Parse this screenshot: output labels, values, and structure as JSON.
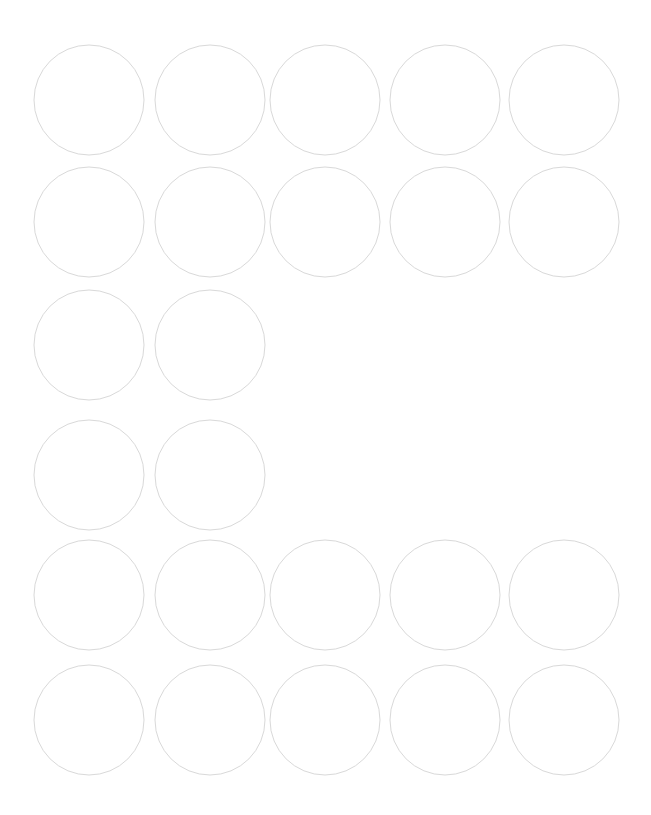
{
  "document": {
    "kind": "circle-label-sheet-template",
    "title": "Circular Label Sheet Template",
    "page_width": 651,
    "page_height": 815,
    "background_color": "#ffffff",
    "visible_text": ""
  },
  "style": {
    "outline_color": "#d9d9d9",
    "outline_width": 1,
    "fill_color": "#ffffff"
  },
  "grid": {
    "columns": 5,
    "rows": 6,
    "circle_diameter": 110,
    "column_centers": [
      89,
      210,
      325,
      445,
      564
    ],
    "row_centers": [
      100,
      222,
      345,
      475,
      595,
      720
    ],
    "column_pitch": 119,
    "row_pitch": 122
  },
  "labels": [
    {
      "id": "r1c1",
      "row": 1,
      "col": 1,
      "cx": 89,
      "cy": 100,
      "r": 55
    },
    {
      "id": "r1c2",
      "row": 1,
      "col": 2,
      "cx": 210,
      "cy": 100,
      "r": 55
    },
    {
      "id": "r1c3",
      "row": 1,
      "col": 3,
      "cx": 325,
      "cy": 100,
      "r": 55
    },
    {
      "id": "r1c4",
      "row": 1,
      "col": 4,
      "cx": 445,
      "cy": 100,
      "r": 55
    },
    {
      "id": "r1c5",
      "row": 1,
      "col": 5,
      "cx": 564,
      "cy": 100,
      "r": 55
    },
    {
      "id": "r2c1",
      "row": 2,
      "col": 1,
      "cx": 89,
      "cy": 222,
      "r": 55
    },
    {
      "id": "r2c2",
      "row": 2,
      "col": 2,
      "cx": 210,
      "cy": 222,
      "r": 55
    },
    {
      "id": "r2c3",
      "row": 2,
      "col": 3,
      "cx": 325,
      "cy": 222,
      "r": 55
    },
    {
      "id": "r2c4",
      "row": 2,
      "col": 4,
      "cx": 445,
      "cy": 222,
      "r": 55
    },
    {
      "id": "r2c5",
      "row": 2,
      "col": 5,
      "cx": 564,
      "cy": 222,
      "r": 55
    },
    {
      "id": "r3c1",
      "row": 3,
      "col": 1,
      "cx": 89,
      "cy": 345,
      "r": 55
    },
    {
      "id": "r3c2",
      "row": 3,
      "col": 2,
      "cx": 210,
      "cy": 345,
      "r": 55
    },
    {
      "id": "r4c1",
      "row": 4,
      "col": 1,
      "cx": 89,
      "cy": 475,
      "r": 55
    },
    {
      "id": "r4c2",
      "row": 4,
      "col": 2,
      "cx": 210,
      "cy": 475,
      "r": 55
    },
    {
      "id": "r5c1",
      "row": 5,
      "col": 1,
      "cx": 89,
      "cy": 595,
      "r": 55
    },
    {
      "id": "r5c2",
      "row": 5,
      "col": 2,
      "cx": 210,
      "cy": 595,
      "r": 55
    },
    {
      "id": "r5c3",
      "row": 5,
      "col": 3,
      "cx": 325,
      "cy": 595,
      "r": 55
    },
    {
      "id": "r5c4",
      "row": 5,
      "col": 4,
      "cx": 445,
      "cy": 595,
      "r": 55
    },
    {
      "id": "r5c5",
      "row": 5,
      "col": 5,
      "cx": 564,
      "cy": 595,
      "r": 55
    },
    {
      "id": "r6c1",
      "row": 6,
      "col": 1,
      "cx": 89,
      "cy": 720,
      "r": 55
    },
    {
      "id": "r6c2",
      "row": 6,
      "col": 2,
      "cx": 210,
      "cy": 720,
      "r": 55
    },
    {
      "id": "r6c3",
      "row": 6,
      "col": 3,
      "cx": 325,
      "cy": 720,
      "r": 55
    },
    {
      "id": "r6c4",
      "row": 6,
      "col": 4,
      "cx": 445,
      "cy": 720,
      "r": 55
    },
    {
      "id": "r6c5",
      "row": 6,
      "col": 5,
      "cx": 564,
      "cy": 720,
      "r": 55
    }
  ]
}
